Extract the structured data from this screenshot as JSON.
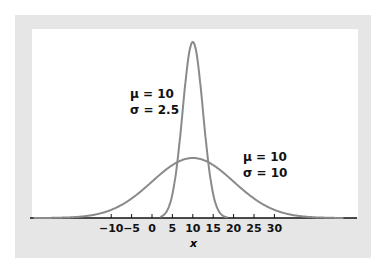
{
  "chart_data": {
    "type": "line",
    "title": "",
    "xlabel": "x",
    "ylabel": "",
    "xlim": [
      -30,
      50
    ],
    "xticks": [
      -10,
      -5,
      0,
      5,
      10,
      15,
      20,
      25,
      30
    ],
    "xtick_labels": [
      "−10",
      "−5",
      "0",
      "5",
      "10",
      "15",
      "20",
      "25",
      "30"
    ],
    "grid": false,
    "legend": "none",
    "series": [
      {
        "name": "narrow normal",
        "mu": 10,
        "sigma": 2.5,
        "label_lines": [
          "μ = 10",
          "σ = 2.5"
        ]
      },
      {
        "name": "wide normal",
        "mu": 10,
        "sigma": 10,
        "label_lines": [
          "μ = 10",
          "σ = 10"
        ]
      }
    ],
    "annotations": [
      "μ = 10",
      "σ = 2.5",
      "μ = 10",
      "σ = 10"
    ]
  },
  "colors": {
    "curve": "#8a8a8a",
    "frame": "#e6e6e6",
    "axis": "#111111"
  }
}
